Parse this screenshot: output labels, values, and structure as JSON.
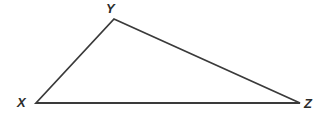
{
  "figure": {
    "kind": "geometry-diagram",
    "shape_name": "triangle",
    "background_color": "#ffffff",
    "stroke_color": "#3a3a3a",
    "stroke_width": 1.8,
    "label_color": "#2b2b2b",
    "canvas": {
      "width": 330,
      "height": 119
    },
    "vertices": [
      {
        "id": "X",
        "label": "X",
        "x": 36,
        "y": 103
      },
      {
        "id": "Y",
        "label": "Y",
        "x": 114,
        "y": 19
      },
      {
        "id": "Z",
        "label": "Z",
        "x": 300,
        "y": 103
      }
    ],
    "edges": [
      {
        "id": "XY",
        "from": "X",
        "to": "Y"
      },
      {
        "id": "YZ",
        "from": "Y",
        "to": "Z"
      },
      {
        "id": "XZ",
        "from": "X",
        "to": "Z"
      }
    ],
    "labels": {
      "vertex_x": "X",
      "vertex_y": "Y",
      "vertex_z": "Z"
    }
  }
}
